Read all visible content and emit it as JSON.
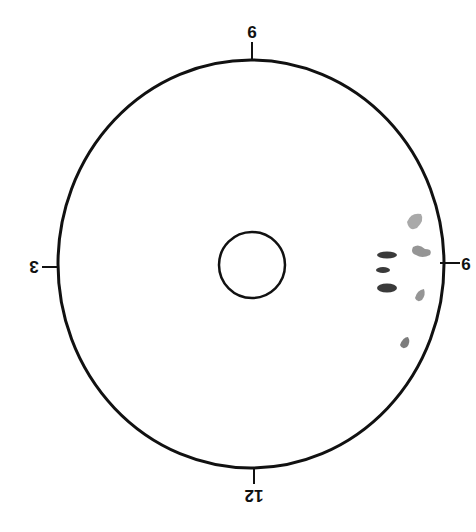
{
  "diagram": {
    "title": "",
    "clock_labels": {
      "top": "9",
      "bottom": "12",
      "left": "3",
      "right": "6"
    },
    "colors": {
      "stroke": "#111111",
      "dark_mark": "#3a3a3a",
      "light_mark": "#8a8a8a"
    },
    "marks": [
      {
        "label": "dark-elongated-mark-1",
        "tone": "dark"
      },
      {
        "label": "dark-elongated-mark-2",
        "tone": "dark"
      },
      {
        "label": "dark-elongated-mark-3",
        "tone": "dark"
      },
      {
        "label": "light-blotch-1",
        "tone": "light"
      },
      {
        "label": "light-blotch-2",
        "tone": "light"
      },
      {
        "label": "light-blotch-3",
        "tone": "light"
      },
      {
        "label": "light-blotch-4",
        "tone": "light"
      }
    ]
  }
}
